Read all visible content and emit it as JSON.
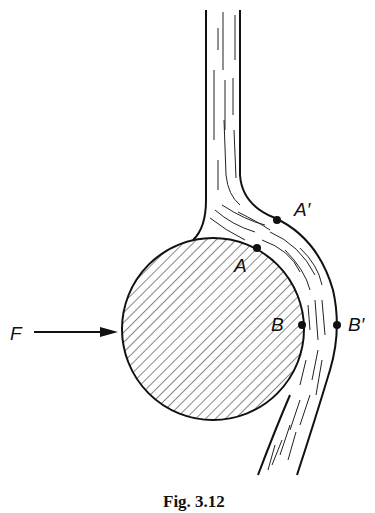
{
  "figure": {
    "caption": "Fig. 3.12",
    "force_label": "F",
    "points": [
      {
        "id": "A_prime",
        "label": "A′",
        "x": 277,
        "y": 220
      },
      {
        "id": "A",
        "label": "A",
        "x": 257,
        "y": 248
      },
      {
        "id": "B",
        "label": "B",
        "x": 302,
        "y": 325
      },
      {
        "id": "B_prime",
        "label": "B′",
        "x": 337,
        "y": 325
      }
    ],
    "colors": {
      "ink": "#111111",
      "background": "#ffffff"
    }
  }
}
